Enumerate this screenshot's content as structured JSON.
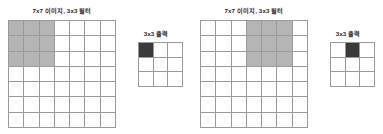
{
  "figure": {
    "background_color": "#ffffff",
    "grid_line_color": "#9a9a9a",
    "highlight_color": "#b5b5b5",
    "active_cell_color": "#3a3a3a",
    "cell_empty_color": "#ffffff"
  },
  "panels": [
    {
      "id": "panel-left",
      "input_caption": "7x7 이미지, 3x3 필터",
      "output_caption": "3x3 출력",
      "input_grid": {
        "rows": 7,
        "cols": 7,
        "highlight_rows": [
          0,
          1,
          2
        ],
        "highlight_cols": [
          0,
          1,
          2
        ]
      },
      "output_grid": {
        "rows": 3,
        "cols": 3,
        "active_row": 0,
        "active_col": 0
      }
    },
    {
      "id": "panel-right",
      "input_caption": "7x7 이미지, 3x3 필터",
      "output_caption": "3x3 출력",
      "input_grid": {
        "rows": 7,
        "cols": 7,
        "highlight_rows": [
          0,
          1,
          2
        ],
        "highlight_cols": [
          3,
          4,
          5
        ]
      },
      "output_grid": {
        "rows": 3,
        "cols": 3,
        "active_row": 0,
        "active_col": 1
      }
    }
  ]
}
